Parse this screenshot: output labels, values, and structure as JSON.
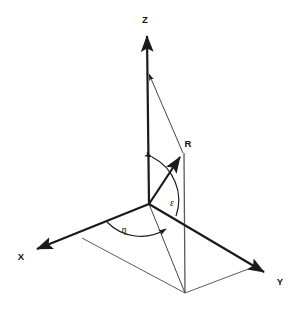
{
  "figure": {
    "type": "3d-coordinate-diagram",
    "background_color": "#ffffff",
    "line_color": "#1a1a1a",
    "thin_line_color": "#555555",
    "width": 300,
    "height": 310
  },
  "axes": {
    "z": {
      "label": "Z",
      "label_x": 145,
      "label_y": 23,
      "from": [
        149,
        204
      ],
      "to": [
        147,
        33
      ],
      "arrow": "up",
      "stroke_width": 2.2
    },
    "x": {
      "label": "X",
      "label_x": 21,
      "label_y": 260,
      "from": [
        149,
        204
      ],
      "to": [
        33,
        251
      ],
      "arrow": "down-left",
      "stroke_width": 2.2
    },
    "y": {
      "label": "Y",
      "label_x": 280,
      "label_y": 285,
      "from": [
        149,
        204
      ],
      "to": [
        268,
        274
      ],
      "arrow": "down-right",
      "stroke_width": 2.2
    }
  },
  "vector": {
    "label": "R",
    "label_x": 188,
    "label_y": 147,
    "from": [
      149,
      204
    ],
    "to": [
      183,
      153
    ],
    "stroke_width": 2.2
  },
  "angles": [
    {
      "name": "epsilon",
      "label": "ε",
      "label_x": 172,
      "label_y": 206,
      "description": "elevation angle between Z axis and R vector"
    },
    {
      "name": "eta",
      "label": "η",
      "label_x": 124,
      "label_y": 233,
      "description": "azimuth angle in XY plane from X axis to ground projection of R"
    }
  ],
  "construction_lines": {
    "z_to_r": {
      "from": [
        148,
        72
      ],
      "to": [
        183,
        153
      ],
      "note": "thin line from Z axis to tip of R"
    },
    "r_drop": {
      "from": [
        184,
        153
      ],
      "to": [
        185,
        293
      ],
      "note": "vertical drop from R tip to XY plane"
    },
    "origin_to_ground": {
      "from": [
        149,
        204
      ],
      "to": [
        185,
        293
      ],
      "note": "ground projection of R"
    }
  },
  "ground_plane": {
    "note": "parallelogram in XY plane",
    "points": [
      [
        149,
        204
      ],
      [
        82,
        238
      ],
      [
        185,
        293
      ],
      [
        251,
        268
      ]
    ]
  }
}
